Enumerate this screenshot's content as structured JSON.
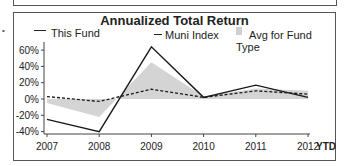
{
  "chart_data": {
    "type": "line",
    "title": "Annualized Total Return",
    "categories": [
      "2007",
      "2008",
      "2009",
      "2010",
      "2011",
      "2012"
    ],
    "x_suffix_label": "YTD",
    "series": [
      {
        "name": "This Fund",
        "style": "solid-line",
        "color": "#1a1a1a",
        "values": [
          -25,
          -40,
          64,
          2,
          17,
          2
        ]
      },
      {
        "name": "Muni Index",
        "style": "dashed-line",
        "color": "#1a1a1a",
        "values": [
          3,
          -3,
          12,
          2,
          10,
          6
        ]
      },
      {
        "name": "Avg for Fund Type",
        "style": "shaded-area",
        "color": "#cccccc",
        "values": [
          -5,
          -22,
          45,
          3,
          13,
          10
        ]
      }
    ],
    "yticks": [
      "60%",
      "40%",
      "20%",
      "0%",
      "-20%",
      "-40%"
    ],
    "ylim": [
      -40,
      60
    ],
    "xlabel": "",
    "ylabel": "",
    "grid": false,
    "legend_position": "top"
  },
  "legend": {
    "fund": "This Fund",
    "index": "Muni Index",
    "avg": "Avg for Fund Type"
  },
  "bullet": "•"
}
